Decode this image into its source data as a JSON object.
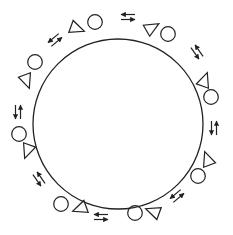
{
  "diagram": {
    "stroke_color": "#222222",
    "background": "#ffffff",
    "central_circle": {
      "cx": 118,
      "cy": 124,
      "r": 85
    },
    "pairs": [
      {
        "id": 1,
        "triangle": {
          "x": 78,
          "y": 29,
          "rot": 20
        },
        "circle": {
          "x": 95,
          "y": 22
        }
      },
      {
        "id": 2,
        "triangle": {
          "x": 153,
          "y": 27,
          "rot": -30
        },
        "circle": {
          "x": 168,
          "y": 34
        }
      },
      {
        "id": 3,
        "triangle": {
          "x": 205,
          "y": 79,
          "rot": -70
        },
        "circle": {
          "x": 211,
          "y": 97
        }
      },
      {
        "id": 4,
        "triangle": {
          "x": 207,
          "y": 158,
          "rot": -110
        },
        "circle": {
          "x": 198,
          "y": 176
        }
      },
      {
        "id": 5,
        "triangle": {
          "x": 152,
          "y": 211,
          "rot": 200
        },
        "circle": {
          "x": 135,
          "y": 213
        }
      },
      {
        "id": 6,
        "triangle": {
          "x": 79,
          "y": 209,
          "rot": 160
        },
        "circle": {
          "x": 61,
          "y": 204
        }
      },
      {
        "id": 7,
        "triangle": {
          "x": 27,
          "y": 152,
          "rot": 110
        },
        "circle": {
          "x": 19,
          "y": 134
        }
      },
      {
        "id": 8,
        "triangle": {
          "x": 27,
          "y": 82,
          "rot": 70
        },
        "circle": {
          "x": 35,
          "y": 62
        }
      }
    ],
    "arrow_pairs": [
      {
        "id": "a1",
        "x": 128,
        "y": 17,
        "angle": 0
      },
      {
        "id": "a2",
        "x": 197,
        "y": 52,
        "angle": 55
      },
      {
        "id": "a3",
        "x": 214,
        "y": 128,
        "angle": 90
      },
      {
        "id": "a4",
        "x": 177,
        "y": 196,
        "angle": 140
      },
      {
        "id": "a5",
        "x": 101,
        "y": 217,
        "angle": 180
      },
      {
        "id": "a6",
        "x": 39,
        "y": 179,
        "angle": 235
      },
      {
        "id": "a7",
        "x": 18,
        "y": 112,
        "angle": 270
      },
      {
        "id": "a8",
        "x": 55,
        "y": 40,
        "angle": 320
      }
    ],
    "legend": {
      "triangle": "triangle-shape",
      "circle": "circle-shape",
      "arrows": "bidirectional-arrow"
    }
  }
}
